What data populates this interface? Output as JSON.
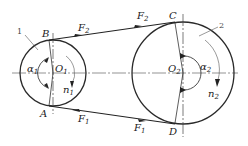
{
  "diagram": {
    "type": "belt-drive-force-diagram",
    "stroke_color": "#2a2a2a",
    "small_pulley": {
      "part_number": "1",
      "center_label": "O",
      "center_sub": "1",
      "angle_label": "α",
      "angle_sub": "1",
      "speed_label": "n",
      "speed_sub": "1",
      "center": [
        53,
        73
      ],
      "radius": 33
    },
    "large_pulley": {
      "part_number": "2",
      "center_label": "O",
      "center_sub": "2",
      "angle_label": "α",
      "angle_sub": "2",
      "speed_label": "n",
      "speed_sub": "2",
      "center": [
        183,
        73
      ],
      "radius": 51
    },
    "points": {
      "B": "B",
      "A": "A",
      "C": "C",
      "D": "D"
    },
    "forces": {
      "tight_side": {
        "label": "F",
        "sub": "2"
      },
      "slack_side": {
        "label": "F",
        "sub": "1"
      }
    }
  }
}
